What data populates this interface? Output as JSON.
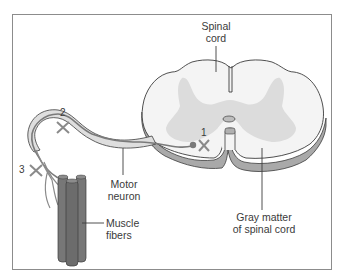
{
  "figure": {
    "labels": {
      "spinal_cord_line1": "Spinal",
      "spinal_cord_line2": "cord",
      "motor_neuron_line1": "Motor",
      "motor_neuron_line2": "neuron",
      "muscle_fibers_line1": "Muscle",
      "muscle_fibers_line2": "fibers",
      "gray_matter_line1": "Gray matter",
      "gray_matter_line2": "of spinal cord"
    },
    "markers": [
      {
        "id": "1",
        "label": "1",
        "location": "cell body in gray matter"
      },
      {
        "id": "2",
        "label": "2",
        "location": "motor neuron axon"
      },
      {
        "id": "3",
        "label": "3",
        "location": "nerve terminal near muscle"
      }
    ],
    "colors": {
      "white_matter": "#f4f4f4",
      "gray_matter": "#dcdcdc",
      "outline": "#3c3c3c",
      "cord_side": "#a9a9a9",
      "nerve_fill": "#dedede",
      "neuron_line": "#7a7a7a",
      "muscle": "#777777",
      "x_mark": "#8a8a8a",
      "frame": "#8c8c8c"
    }
  }
}
